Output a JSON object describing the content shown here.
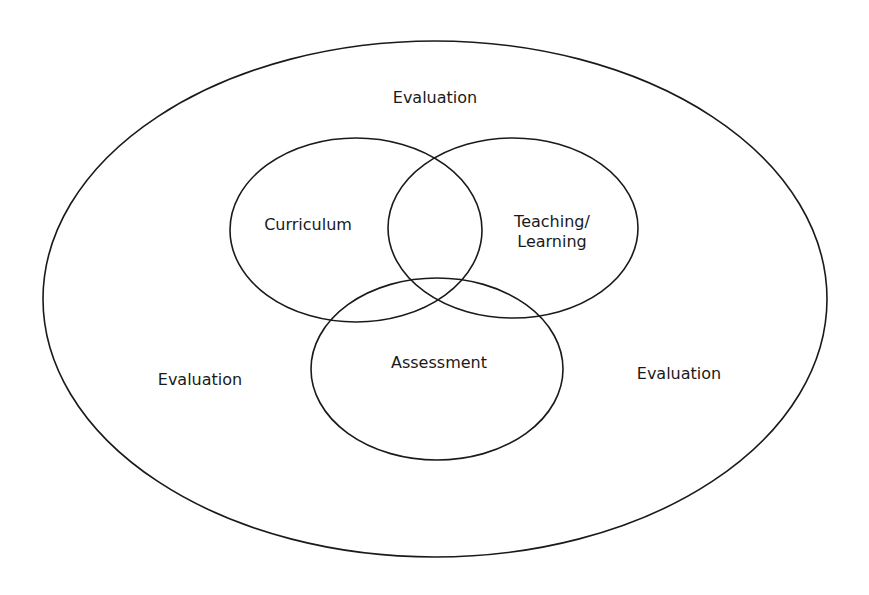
{
  "diagram": {
    "type": "nested venn diagram",
    "outer": {
      "label_top": "Evaluation",
      "label_left": "Evaluation",
      "label_right": "Evaluation"
    },
    "circles": [
      {
        "label": "Curriculum"
      },
      {
        "label_line1": "Teaching/",
        "label_line2": "Learning"
      },
      {
        "label": "Assessment"
      }
    ],
    "stroke_color": "#1a1a1a",
    "background": "#ffffff"
  }
}
